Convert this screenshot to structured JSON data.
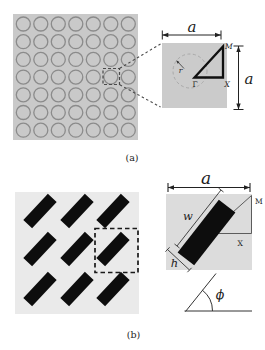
{
  "colors": {
    "page_bg": "#ffffff",
    "array_a_bg": "#c9c9c9",
    "circle_stroke": "#8b8b8b",
    "cell_a_bg": "#cbcbcb",
    "dashed_circle_stroke": "#a9a9a9",
    "triangle_a_stroke": "#101010",
    "array_b_bg": "#eaeaea",
    "bar_fill": "#0d0d0d",
    "cell_b_bg": "#dcdcdc",
    "thin_line": "#4d4d4d",
    "dash_line": "#4a4a4a"
  },
  "figure_a": {
    "caption": "(a)",
    "array": {
      "rows": 7,
      "cols": 7,
      "shape": "circular hole"
    },
    "unit_cell": {
      "dim_top": "a",
      "dim_right": "a",
      "radius_label": "r",
      "gamma_label": "Γ",
      "m_label": "M",
      "x_label": "X"
    }
  },
  "figure_b": {
    "caption": "(b)",
    "array": {
      "rows": 3,
      "cols": 3,
      "shape": "rotated bar"
    },
    "unit_cell": {
      "dim_top": "a",
      "bar_width_label": "w",
      "bar_height_label": "h",
      "m_label": "M",
      "x_label": "X"
    },
    "angle": {
      "label": "ϕ"
    }
  }
}
